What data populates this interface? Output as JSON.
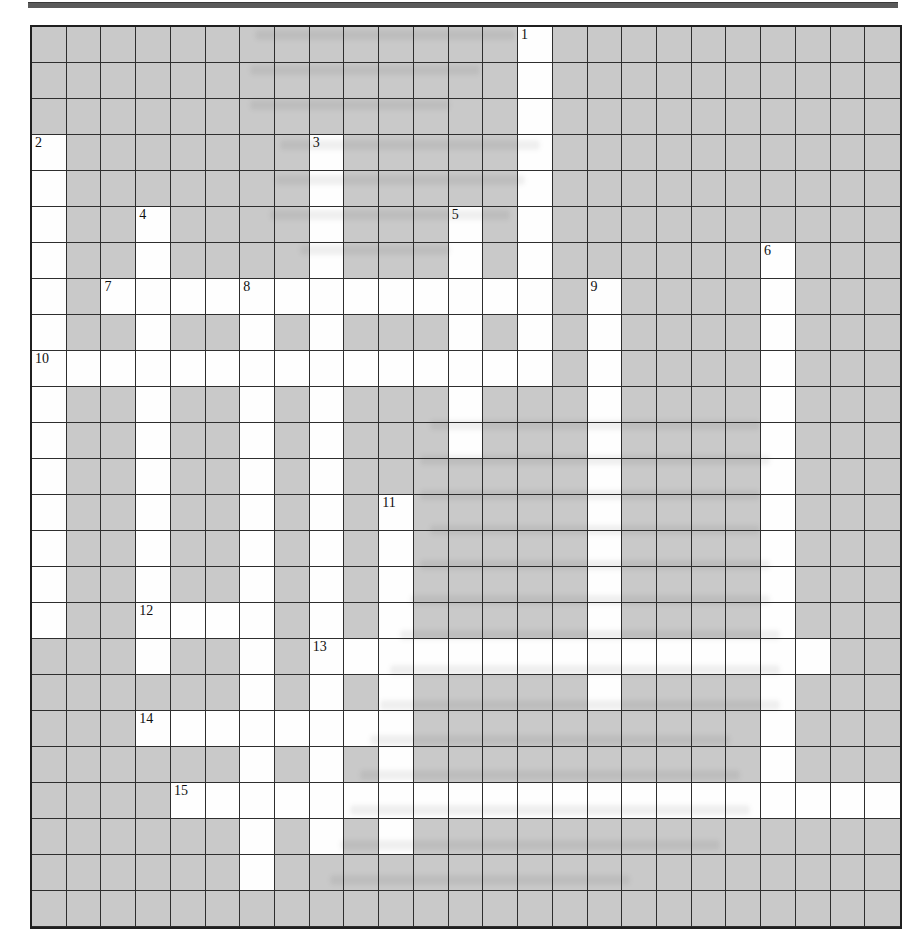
{
  "page": {
    "background": "#ffffff",
    "top_rule_color": "#5a5a5a"
  },
  "grid": {
    "columns": 25,
    "rows": 25,
    "shaded_fill": "#c9c9c9",
    "white_fill": "#fefefe",
    "line_color": "#2e2e2e",
    "border_color": "#1f1f1f",
    "rows_map": [
      "##############.##########",
      "##############.##########",
      "##############.##########",
      ".#######.#####.##########",
      ".#######.#####.##########",
      ".##.####.###.#.##########",
      ".##.####.###.#.######.###",
      ".#.............#.####.###",
      ".##.##.#.###.#.#.####.###",
      "...............#.####.###",
      ".##.##.#.###.###.####.###",
      ".##.##.#.###.###.####.###",
      ".##.##.#.#######.####.###",
      ".##.##.#.#.#####.####.###",
      ".##.##.#.#.#####.####.###",
      ".##.##.#.#.#####.####.###",
      ".##....#.#.#####.####.###",
      "###.##.#...............##",
      "######.#.#.#####.####.###",
      "###........##########.###",
      "######.#.#.##########.###",
      "####.....................",
      "######.#.#.##############",
      "######.##################",
      "#########################"
    ],
    "numbers": [
      {
        "label": "1",
        "row": 0,
        "col": 14
      },
      {
        "label": "2",
        "row": 3,
        "col": 0
      },
      {
        "label": "3",
        "row": 3,
        "col": 8
      },
      {
        "label": "4",
        "row": 5,
        "col": 3
      },
      {
        "label": "5",
        "row": 5,
        "col": 12
      },
      {
        "label": "6",
        "row": 6,
        "col": 21
      },
      {
        "label": "7",
        "row": 7,
        "col": 2
      },
      {
        "label": "8",
        "row": 7,
        "col": 6
      },
      {
        "label": "9",
        "row": 7,
        "col": 16
      },
      {
        "label": "10",
        "row": 9,
        "col": 0
      },
      {
        "label": "11",
        "row": 13,
        "col": 10
      },
      {
        "label": "12",
        "row": 16,
        "col": 3
      },
      {
        "label": "13",
        "row": 17,
        "col": 8
      },
      {
        "label": "14",
        "row": 19,
        "col": 3
      },
      {
        "label": "15",
        "row": 21,
        "col": 4
      }
    ],
    "bleed_marks": [
      {
        "x": 255,
        "y": 30,
        "w": 260
      },
      {
        "x": 250,
        "y": 65,
        "w": 230
      },
      {
        "x": 250,
        "y": 100,
        "w": 200
      },
      {
        "x": 280,
        "y": 140,
        "w": 260
      },
      {
        "x": 275,
        "y": 175,
        "w": 250
      },
      {
        "x": 270,
        "y": 210,
        "w": 240
      },
      {
        "x": 300,
        "y": 245,
        "w": 150
      },
      {
        "x": 430,
        "y": 420,
        "w": 330
      },
      {
        "x": 420,
        "y": 455,
        "w": 350
      },
      {
        "x": 420,
        "y": 490,
        "w": 340
      },
      {
        "x": 430,
        "y": 525,
        "w": 330
      },
      {
        "x": 420,
        "y": 560,
        "w": 350
      },
      {
        "x": 410,
        "y": 595,
        "w": 360
      },
      {
        "x": 400,
        "y": 630,
        "w": 380
      },
      {
        "x": 390,
        "y": 665,
        "w": 390
      },
      {
        "x": 380,
        "y": 700,
        "w": 400
      },
      {
        "x": 370,
        "y": 735,
        "w": 360
      },
      {
        "x": 360,
        "y": 770,
        "w": 380
      },
      {
        "x": 350,
        "y": 805,
        "w": 400
      },
      {
        "x": 340,
        "y": 840,
        "w": 380
      },
      {
        "x": 330,
        "y": 875,
        "w": 300
      }
    ]
  }
}
